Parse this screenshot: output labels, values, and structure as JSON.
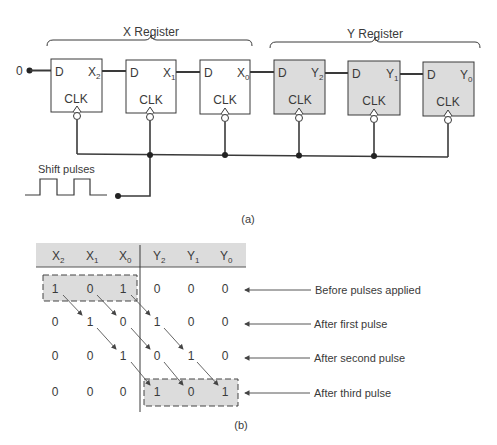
{
  "part_a": {
    "caption": "(a)",
    "x_register_label": "X Register",
    "y_register_label": "Y Register",
    "serial_input": "0",
    "shift_pulses_label": "Shift pulses",
    "flipflops": [
      {
        "d": "D",
        "q": "X",
        "sub": "2",
        "clk": "CLK",
        "shaded": false
      },
      {
        "d": "D",
        "q": "X",
        "sub": "1",
        "clk": "CLK",
        "shaded": false
      },
      {
        "d": "D",
        "q": "X",
        "sub": "0",
        "clk": "CLK",
        "shaded": false
      },
      {
        "d": "D",
        "q": "Y",
        "sub": "2",
        "clk": "CLK",
        "shaded": true
      },
      {
        "d": "D",
        "q": "Y",
        "sub": "1",
        "clk": "CLK",
        "shaded": true
      },
      {
        "d": "D",
        "q": "Y",
        "sub": "0",
        "clk": "CLK",
        "shaded": true
      }
    ]
  },
  "part_b": {
    "caption": "(b)",
    "headers": [
      {
        "base": "X",
        "sub": "2"
      },
      {
        "base": "X",
        "sub": "1"
      },
      {
        "base": "X",
        "sub": "0"
      },
      {
        "base": "Y",
        "sub": "2"
      },
      {
        "base": "Y",
        "sub": "1"
      },
      {
        "base": "Y",
        "sub": "0"
      }
    ],
    "rows": [
      {
        "values": [
          "1",
          "0",
          "1",
          "0",
          "0",
          "0"
        ],
        "label": "Before pulses applied"
      },
      {
        "values": [
          "0",
          "1",
          "0",
          "1",
          "0",
          "0"
        ],
        "label": "After first pulse"
      },
      {
        "values": [
          "0",
          "0",
          "1",
          "0",
          "1",
          "0"
        ],
        "label": "After second pulse"
      },
      {
        "values": [
          "0",
          "0",
          "0",
          "1",
          "0",
          "1"
        ],
        "label": "After third pulse"
      }
    ]
  },
  "colors": {
    "shade": "#dcdcdc",
    "line": "#3a3a3a"
  }
}
